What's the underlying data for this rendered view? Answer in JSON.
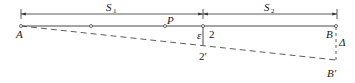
{
  "diagram": {
    "type": "beam-displacement-schematic",
    "dimensions": {
      "s1": {
        "symbol": "S",
        "subscript": "1"
      },
      "s2": {
        "symbol": "S",
        "subscript": "2"
      }
    },
    "points": {
      "a": "A",
      "p": "P",
      "two": "2",
      "b": "B",
      "two_prime": "2′",
      "b_prime": "B′"
    },
    "annotations": {
      "epsilon": "ε",
      "delta": "Δ"
    },
    "colors": {
      "line": "#333333",
      "text": "#1a1a1a",
      "background": "#ffffff"
    }
  }
}
